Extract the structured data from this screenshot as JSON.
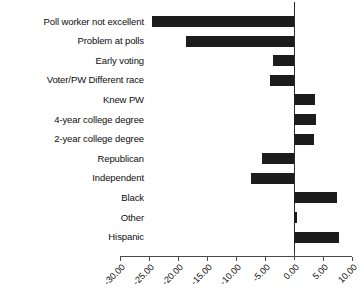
{
  "chart_data": {
    "type": "bar",
    "orientation": "horizontal",
    "title": "",
    "subtitle": "",
    "xlabel": "",
    "ylabel": "",
    "grid": false,
    "legend": null,
    "xlim": [
      -31.5,
      11.5
    ],
    "xticks": [
      -30,
      -25,
      -20,
      -15,
      -10,
      -5,
      0,
      5,
      10
    ],
    "xtick_labels": [
      "-30.00",
      "-25.00",
      "-20.00",
      "-15.00",
      "-10.00",
      "-5.00",
      "0.00",
      "5.00",
      "10.00"
    ],
    "bar_color": "#1c1c1c",
    "zero_line_color": "#2b2b2b",
    "axis_color": "#4a4a4a",
    "categories": [
      "Poll worker not excellent",
      "Problem at polls",
      "Early voting",
      "Voter/PW Different race",
      "Knew PW",
      "4-year college degree",
      "2-year college degree",
      "Republican",
      "Independent",
      "Black",
      "Other",
      "Hispanic"
    ],
    "values": [
      -24.4,
      -18.7,
      -3.6,
      -4.2,
      3.7,
      3.8,
      3.4,
      -5.6,
      -7.4,
      7.4,
      0.6,
      7.7
    ]
  }
}
